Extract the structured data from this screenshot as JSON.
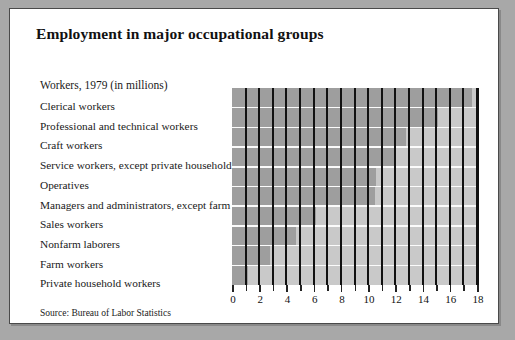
{
  "figure": {
    "title": "Employment in major occupational groups",
    "units_caption": "Workers, 1979 (in millions)",
    "source": "Source: Bureau of Labor Statistics"
  },
  "colors": {
    "page_background": "#a8a8a8",
    "panel_background": "#ffffff",
    "panel_border": "#4a4a4a",
    "plot_background": "#c9c9c9",
    "bar_fill": "#9e9e9e",
    "gridline": "#111111",
    "row_separator": "#fbfbfb",
    "text": "#111111"
  },
  "chart_data": {
    "type": "bar",
    "orientation": "horizontal",
    "title": "Employment in major occupational groups",
    "subtitle": "Workers, 1979 (in millions)",
    "xlabel": "",
    "ylabel": "",
    "xlim": [
      0,
      18
    ],
    "grid": true,
    "gridlines_every": 1,
    "legend": "none",
    "xticks": [
      0,
      2,
      4,
      6,
      8,
      10,
      12,
      14,
      16,
      18
    ],
    "xticklabels": [
      "0",
      "2",
      "4",
      "6",
      "8",
      "10",
      "12",
      "14",
      "16",
      "18"
    ],
    "categories": [
      "Clerical workers",
      "Professional and technical workers",
      "Craft workers",
      "Service workers, except private household",
      "Operatives",
      "Managers and administrators, except farm",
      "Sales workers",
      "Nonfarm laborers",
      "Farm workers",
      "Private household workers"
    ],
    "values": [
      17.6,
      15.1,
      12.8,
      12.0,
      10.6,
      10.5,
      6.2,
      4.7,
      2.8,
      1.2
    ],
    "source": "Source: Bureau of Labor Statistics"
  }
}
